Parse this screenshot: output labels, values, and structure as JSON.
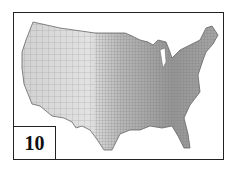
{
  "figure": {
    "panel_label": "10",
    "colors": {
      "frame": "#222222",
      "west_fill": "#dcdcdc",
      "east_fill": "#9a9a9a",
      "county_lines": "#777777"
    }
  }
}
